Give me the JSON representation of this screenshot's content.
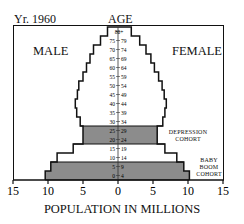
{
  "header": {
    "year": "Yr. 1960",
    "age_title": "AGE"
  },
  "labels": {
    "male": "MALE",
    "female": "FEMALE",
    "depression": "DEPRESSION\nCOHORT",
    "babyboom": "BABY\nBOOM\nCOHORT"
  },
  "chart_data": {
    "type": "bar",
    "subtype": "population-pyramid",
    "title": "Yr. 1960",
    "xlabel": "POPULATION IN MILLIONS",
    "ylabel": "AGE",
    "xlim": [
      -15,
      15
    ],
    "xticks": [
      "15",
      "10",
      "5",
      "0",
      "5",
      "10",
      "15"
    ],
    "categories": [
      "0-4",
      "5-9",
      "10-14",
      "15-19",
      "20-24",
      "25-29",
      "30-34",
      "35-39",
      "40-44",
      "45-49",
      "50-54",
      "55-59",
      "60-64",
      "65-69",
      "70-74",
      "75-79",
      "80+"
    ],
    "series": [
      {
        "name": "MALE",
        "values": [
          10.4,
          9.6,
          8.7,
          6.4,
          5.0,
          5.0,
          5.4,
          5.9,
          6.1,
          5.8,
          5.6,
          5.0,
          4.5,
          4.0,
          3.5,
          2.5,
          1.5
        ]
      },
      {
        "name": "FEMALE",
        "values": [
          10.2,
          9.4,
          8.4,
          6.7,
          5.6,
          5.6,
          6.4,
          6.7,
          6.9,
          6.6,
          6.3,
          5.8,
          5.2,
          4.7,
          4.0,
          3.1,
          1.9
        ]
      }
    ],
    "highlighted": [
      {
        "label": "DEPRESSION COHORT",
        "categories": [
          "20-24",
          "25-29"
        ]
      },
      {
        "label": "BABY BOOM COHORT",
        "categories": [
          "0-4",
          "5-9"
        ]
      }
    ],
    "grid": false,
    "legend": "none"
  }
}
